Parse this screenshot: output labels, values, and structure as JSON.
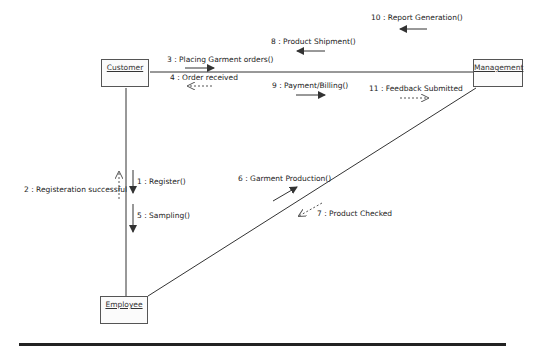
{
  "diagram": {
    "type": "UML communication diagram",
    "objects": [
      {
        "id": "customer",
        "label": "Customer"
      },
      {
        "id": "management",
        "label": "Management"
      },
      {
        "id": "employee",
        "label": "Employee"
      }
    ],
    "links": [
      {
        "from": "customer",
        "to": "management"
      },
      {
        "from": "customer",
        "to": "employee"
      },
      {
        "from": "employee",
        "to": "management"
      }
    ],
    "messages": [
      {
        "label": "1 : Register()",
        "from": "customer",
        "to": "employee",
        "style": "solid"
      },
      {
        "label": "2 : Registeration successful",
        "from": "employee",
        "to": "customer",
        "style": "dashed"
      },
      {
        "label": "3 : Placing Garment orders()",
        "from": "customer",
        "to": "management",
        "style": "solid"
      },
      {
        "label": "4 : Order received",
        "from": "management",
        "to": "customer",
        "style": "dashed"
      },
      {
        "label": "5 : Sampling()",
        "from": "customer",
        "to": "employee",
        "style": "solid"
      },
      {
        "label": "6 : Garment Production()",
        "from": "employee",
        "to": "management",
        "style": "solid"
      },
      {
        "label": "7 : Product Checked",
        "from": "management",
        "to": "employee",
        "style": "dashed"
      },
      {
        "label": "8 : Product Shipment()",
        "from": "management",
        "to": "customer",
        "style": "solid"
      },
      {
        "label": "9 : Payment/Billing()",
        "from": "customer",
        "to": "management",
        "style": "solid"
      },
      {
        "label": "10 : Report Generation()",
        "from": "management",
        "to": "customer",
        "style": "solid"
      },
      {
        "label": "11 : Feedback Submitted",
        "from": "customer",
        "to": "management",
        "style": "dashed"
      }
    ]
  }
}
